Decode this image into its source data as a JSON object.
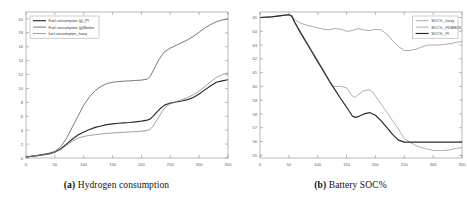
{
  "figure": {
    "caption_a_prefix": "(a)",
    "caption_a_text": "Hydrogen consumption",
    "caption_b_prefix": "(b)",
    "caption_b_text": "Battery SOC%"
  },
  "chart_data": [
    {
      "type": "line",
      "panel": "a",
      "title": "",
      "xlabel": "",
      "ylabel": "",
      "xlim": [
        0,
        350
      ],
      "ylim": [
        0,
        21
      ],
      "xticks": [
        0,
        50,
        100,
        150,
        200,
        250,
        300,
        350
      ],
      "yticks": [
        0,
        2,
        4,
        6,
        8,
        10,
        12,
        14,
        16,
        18,
        20
      ],
      "grid": false,
      "legend_position": "upper-left",
      "series": [
        {
          "name": "Fuel consumption (g)_PI",
          "color": "#2b2b2b",
          "width": 1.15,
          "x": [
            0,
            20,
            40,
            50,
            60,
            70,
            80,
            90,
            100,
            110,
            120,
            130,
            140,
            150,
            160,
            170,
            180,
            190,
            200,
            210,
            215,
            220,
            230,
            240,
            250,
            260,
            270,
            280,
            290,
            300,
            310,
            320,
            330,
            340,
            350
          ],
          "y": [
            0.15,
            0.35,
            0.6,
            0.85,
            1.3,
            2.0,
            2.7,
            3.3,
            3.75,
            4.1,
            4.4,
            4.6,
            4.8,
            4.9,
            5.0,
            5.05,
            5.1,
            5.2,
            5.3,
            5.45,
            5.6,
            6.0,
            6.9,
            7.6,
            7.9,
            8.05,
            8.2,
            8.4,
            8.7,
            9.2,
            9.8,
            10.4,
            10.9,
            11.1,
            11.25
          ]
        },
        {
          "name": "Fuel consumption (g)Menke",
          "color": "#4d4d4d",
          "width": 0.75,
          "x": [
            0,
            20,
            40,
            50,
            60,
            70,
            80,
            90,
            100,
            110,
            120,
            130,
            140,
            150,
            160,
            170,
            180,
            190,
            200,
            210,
            215,
            220,
            230,
            240,
            250,
            260,
            270,
            280,
            290,
            300,
            310,
            320,
            330,
            340,
            350
          ],
          "y": [
            0.15,
            0.4,
            0.7,
            0.95,
            1.6,
            2.8,
            4.4,
            6.0,
            7.6,
            8.8,
            9.7,
            10.3,
            10.7,
            10.9,
            11.0,
            11.05,
            11.1,
            11.15,
            11.2,
            11.35,
            11.7,
            12.5,
            14.1,
            15.3,
            15.8,
            16.2,
            16.6,
            17.0,
            17.5,
            18.1,
            18.7,
            19.2,
            19.6,
            19.85,
            20.0
          ]
        },
        {
          "name": "fuel consumption_fuzzy",
          "color": "#808080",
          "width": 0.75,
          "x": [
            0,
            20,
            40,
            50,
            60,
            70,
            80,
            90,
            100,
            110,
            120,
            130,
            140,
            150,
            160,
            170,
            180,
            190,
            200,
            210,
            215,
            220,
            230,
            240,
            250,
            260,
            270,
            280,
            290,
            300,
            310,
            320,
            330,
            340,
            350
          ],
          "y": [
            0.15,
            0.35,
            0.6,
            0.85,
            1.2,
            1.8,
            2.4,
            2.85,
            3.1,
            3.25,
            3.35,
            3.45,
            3.55,
            3.6,
            3.65,
            3.7,
            3.75,
            3.8,
            3.85,
            3.95,
            4.1,
            4.6,
            5.9,
            7.2,
            7.8,
            8.1,
            8.4,
            8.7,
            9.1,
            9.6,
            10.3,
            11.0,
            11.6,
            12.0,
            12.25
          ]
        }
      ]
    },
    {
      "type": "line",
      "panel": "b",
      "title": "",
      "xlabel": "",
      "ylabel": "",
      "xlim": [
        0,
        350
      ],
      "ylim": [
        54.8,
        65.4
      ],
      "xticks": [
        0,
        50,
        100,
        150,
        200,
        250,
        300,
        350
      ],
      "yticks": [
        55,
        56,
        57,
        58,
        59,
        60,
        61,
        62,
        63,
        64,
        65
      ],
      "grid": false,
      "legend_position": "upper-right",
      "series": [
        {
          "name": "SOC% _fuzzy",
          "color": "#8c8c8c",
          "width": 0.75,
          "x": [
            0,
            20,
            40,
            50,
            55,
            60,
            70,
            80,
            90,
            100,
            110,
            120,
            130,
            140,
            150,
            160,
            170,
            180,
            190,
            200,
            210,
            220,
            230,
            240,
            250,
            260,
            270,
            280,
            290,
            300,
            310,
            320,
            330,
            340,
            350
          ],
          "y": [
            65.0,
            65.05,
            65.15,
            65.2,
            65.15,
            64.85,
            64.6,
            64.45,
            64.35,
            64.25,
            64.15,
            64.1,
            64.2,
            64.15,
            64.0,
            64.05,
            64.2,
            64.1,
            64.05,
            64.15,
            64.1,
            63.8,
            63.3,
            62.9,
            62.6,
            62.6,
            62.7,
            62.85,
            63.0,
            63.0,
            63.0,
            63.05,
            63.1,
            63.2,
            63.25
          ]
        },
        {
          "color": "#9a9a9a",
          "name": "SOC% _FDBMCS",
          "width": 0.8,
          "x": [
            0,
            20,
            40,
            50,
            55,
            60,
            70,
            80,
            90,
            100,
            110,
            120,
            125,
            130,
            140,
            150,
            155,
            160,
            165,
            170,
            180,
            190,
            195,
            200,
            210,
            220,
            230,
            240,
            250,
            260,
            270,
            280,
            290,
            300,
            310,
            320,
            330,
            340,
            350
          ],
          "y": [
            65.0,
            65.05,
            65.15,
            65.2,
            65.1,
            64.7,
            64.0,
            63.3,
            62.6,
            61.9,
            61.2,
            60.4,
            60.0,
            60.0,
            60.0,
            59.9,
            59.6,
            59.3,
            59.2,
            59.4,
            59.7,
            59.75,
            59.6,
            59.3,
            58.7,
            58.1,
            57.5,
            56.9,
            56.2,
            55.95,
            55.7,
            55.55,
            55.45,
            55.35,
            55.35,
            55.35,
            55.4,
            55.5,
            55.55
          ]
        },
        {
          "name": "SOC% _PI",
          "color": "#2b2b2b",
          "width": 1.2,
          "x": [
            0,
            20,
            40,
            50,
            55,
            60,
            70,
            80,
            90,
            100,
            110,
            120,
            130,
            140,
            150,
            160,
            165,
            170,
            180,
            190,
            195,
            200,
            210,
            220,
            230,
            240,
            250,
            260,
            270,
            280,
            290,
            300,
            310,
            320,
            330,
            340,
            350
          ],
          "y": [
            65.0,
            65.05,
            65.15,
            65.2,
            65.1,
            64.65,
            63.9,
            63.2,
            62.5,
            61.8,
            61.1,
            60.4,
            59.75,
            59.1,
            58.5,
            57.85,
            57.75,
            57.8,
            58.0,
            58.1,
            58.0,
            57.9,
            57.5,
            57.0,
            56.5,
            56.1,
            55.95,
            55.95,
            55.95,
            55.95,
            55.95,
            55.95,
            55.95,
            55.95,
            55.95,
            55.95,
            55.95
          ]
        }
      ]
    }
  ]
}
